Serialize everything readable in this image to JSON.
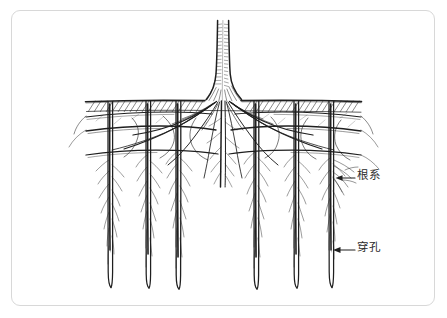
{
  "figure": {
    "title": "",
    "domain_subject": "tree-root-system-with-vertical-perforations-diagram",
    "style": "hand-drawn-ink-line-illustration",
    "frame": {
      "border_color": "#d8d8d8",
      "background_color": "#ffffff",
      "corner_radius_px": 9
    },
    "ink_color": "#1f1f1f",
    "soil_line_y": 101,
    "drawing_bounds": {
      "x": 85,
      "y": 20,
      "width": 280,
      "height": 270
    }
  },
  "annotations": [
    {
      "id": "root-system",
      "label": "根系",
      "arrow": {
        "from_x": 355,
        "from_y": 178,
        "to_x": 336,
        "to_y": 178,
        "direction": "left"
      },
      "label_x": 357,
      "label_y": 170
    },
    {
      "id": "perforation",
      "label": "穿孔",
      "arrow": {
        "from_x": 355,
        "from_y": 250,
        "to_x": 333,
        "to_y": 250,
        "direction": "left"
      },
      "label_x": 357,
      "label_y": 242
    }
  ],
  "elements": {
    "trunk": {
      "name": "tree-trunk",
      "top_y": 20,
      "base_y": 101,
      "center_x": 223,
      "top_width": 11,
      "base_width": 26
    },
    "soil_surface": {
      "name": "soil-surface-line",
      "x_start": 85,
      "x_end": 362,
      "y": 101,
      "hatch": "diagonal"
    },
    "perforation_columns": {
      "name": "vertical-perforation-channels",
      "count": 6,
      "x_positions": [
        110,
        148,
        178,
        256,
        296,
        331
      ],
      "top_y": 101,
      "bottom_y": 288,
      "width": 5
    },
    "lateral_root_bands": {
      "name": "horizontal-lateral-roots",
      "y_positions": [
        113,
        127,
        151
      ]
    },
    "taproot": {
      "name": "central-taproot-mass",
      "center_x": 223,
      "top_y": 101,
      "bottom_y": 180
    }
  }
}
